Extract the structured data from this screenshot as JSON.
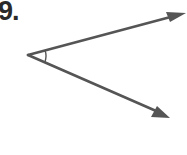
{
  "problem": {
    "number_label": "9."
  },
  "figure": {
    "type": "angle",
    "stroke_color": "#555555",
    "vertex": [
      28,
      55
    ],
    "ray_upper": {
      "tip": [
        185,
        13
      ]
    },
    "ray_lower": {
      "tip": [
        170,
        118
      ]
    },
    "angle_mark": "single-arc"
  }
}
